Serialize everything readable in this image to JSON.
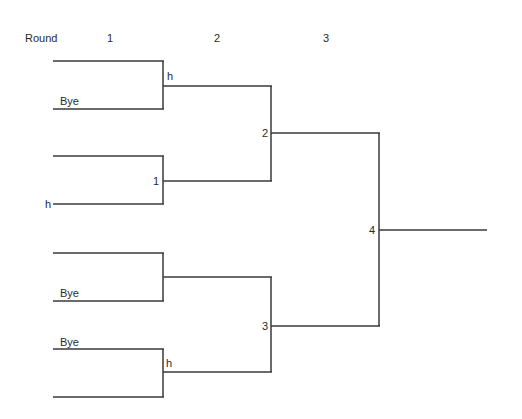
{
  "header": {
    "round_label": "Round",
    "rounds": [
      "1",
      "2",
      "3"
    ]
  },
  "bracket": {
    "round1": [
      {
        "match": "",
        "winner_label": "h",
        "slots": [
          "",
          "Bye"
        ]
      },
      {
        "match": "1",
        "winner_label": "",
        "slots": [
          "",
          "h"
        ]
      },
      {
        "match": "",
        "winner_label": "",
        "slots": [
          "",
          "Bye"
        ]
      },
      {
        "match": "",
        "winner_label": "h",
        "slots": [
          "Bye",
          ""
        ]
      }
    ],
    "round2": [
      {
        "match": "2"
      },
      {
        "match": "3"
      }
    ],
    "round3": [
      {
        "match": "4"
      }
    ]
  }
}
